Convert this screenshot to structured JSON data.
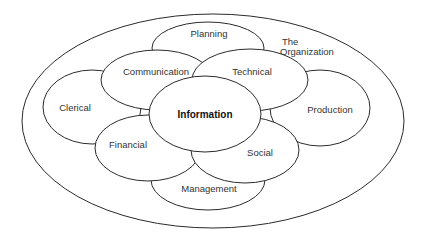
{
  "diagram": {
    "title": "The Organization",
    "outer_label_line1": "The",
    "outer_label_line2": "Organization",
    "center": "Information",
    "nodes": {
      "planning": "Planning",
      "communication": "Communication",
      "technical": "Technical",
      "clerical": "Clerical",
      "production": "Production",
      "financial": "Financial",
      "social": "Social",
      "management": "Management"
    },
    "colors": {
      "stroke": "#2b2b2b",
      "fill": "#ffffff",
      "text": "#333333"
    }
  }
}
